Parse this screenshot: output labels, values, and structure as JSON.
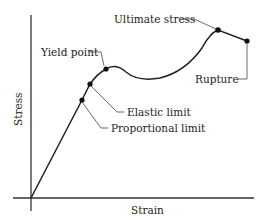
{
  "diagram": {
    "axes": {
      "x_label": "Strain",
      "y_label": "Stress"
    },
    "points": [
      {
        "id": "proportional-limit",
        "label": "Proportional limit"
      },
      {
        "id": "elastic-limit",
        "label": "Elastic limit"
      },
      {
        "id": "yield-point",
        "label": "Yield point"
      },
      {
        "id": "ultimate-stress",
        "label": "Ultimate stress"
      },
      {
        "id": "rupture",
        "label": "Rupture"
      }
    ],
    "colors": {
      "curve": "#222222",
      "background": "#ffffff"
    }
  }
}
